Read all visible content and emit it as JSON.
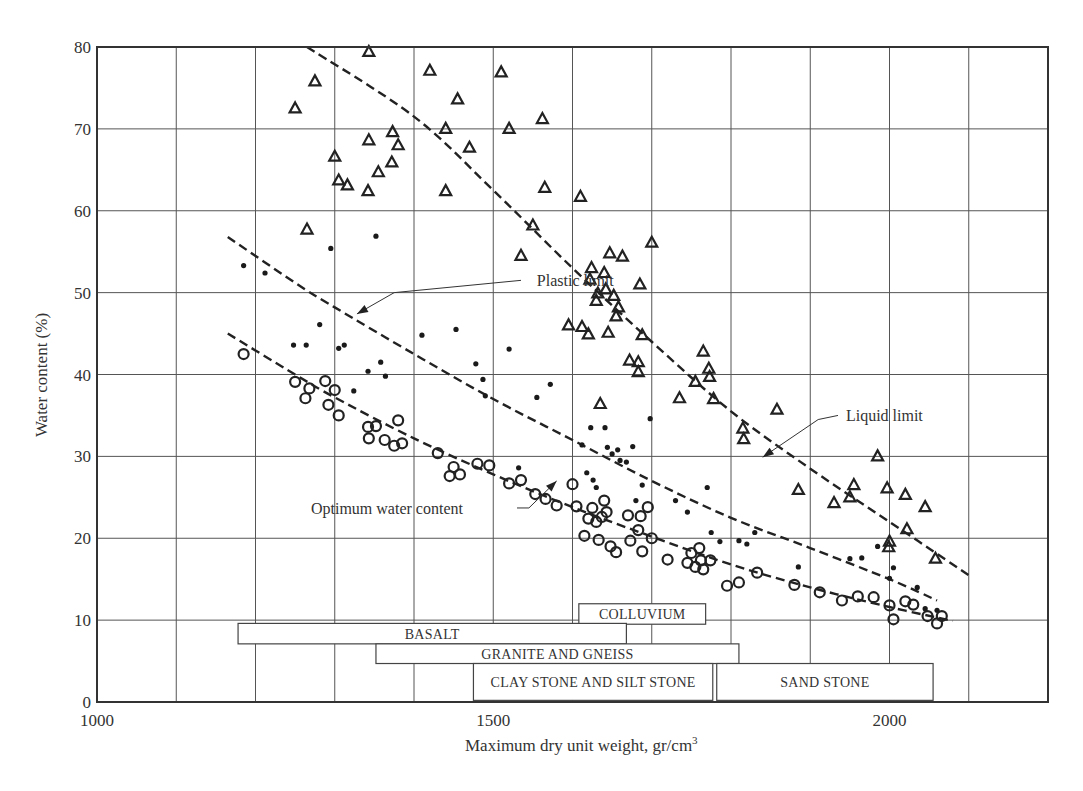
{
  "chart_data": {
    "type": "scatter",
    "title": "",
    "xlabel": "Maximum dry unit weight, gr/cm",
    "xlabel_superscript": "3",
    "ylabel": "Water content (%)",
    "xlim": [
      1000,
      2200
    ],
    "ylim": [
      0,
      80
    ],
    "grid": true,
    "x_gridlines": [
      1100,
      1200,
      1300,
      1400,
      1500,
      1600,
      1700,
      1800,
      1900,
      2000,
      2100
    ],
    "y_gridlines": [
      10,
      20,
      30,
      40,
      50,
      60,
      70
    ],
    "x_ticks": [
      {
        "value": 1000,
        "label": "1000"
      },
      {
        "value": 1500,
        "label": "1500"
      },
      {
        "value": 2000,
        "label": "2000"
      }
    ],
    "y_ticks": [
      {
        "value": 0,
        "label": "0"
      },
      {
        "value": 10,
        "label": "10"
      },
      {
        "value": 20,
        "label": "20"
      },
      {
        "value": 30,
        "label": "30"
      },
      {
        "value": 40,
        "label": "40"
      },
      {
        "value": 50,
        "label": "50"
      },
      {
        "value": 60,
        "label": "60"
      },
      {
        "value": 70,
        "label": "70"
      },
      {
        "value": 80,
        "label": "80"
      }
    ],
    "series": [
      {
        "name": "Liquid limit",
        "marker": "triangle",
        "points": [
          [
            1250,
            72.5
          ],
          [
            1265,
            57.7
          ],
          [
            1275,
            75.8
          ],
          [
            1300,
            66.6
          ],
          [
            1305,
            63.7
          ],
          [
            1316,
            63.1
          ],
          [
            1342,
            62.4
          ],
          [
            1343,
            68.6
          ],
          [
            1343,
            79.4
          ],
          [
            1355,
            64.7
          ],
          [
            1372,
            65.9
          ],
          [
            1373,
            69.6
          ],
          [
            1380,
            68.0
          ],
          [
            1420,
            77.1
          ],
          [
            1440,
            70.0
          ],
          [
            1440,
            62.4
          ],
          [
            1455,
            73.6
          ],
          [
            1470,
            67.7
          ],
          [
            1510,
            76.9
          ],
          [
            1520,
            70.0
          ],
          [
            1535,
            54.5
          ],
          [
            1550,
            58.2
          ],
          [
            1562,
            71.2
          ],
          [
            1565,
            62.8
          ],
          [
            1595,
            46.0
          ],
          [
            1610,
            61.7
          ],
          [
            1612,
            45.8
          ],
          [
            1620,
            44.9
          ],
          [
            1622,
            51.6
          ],
          [
            1624,
            53.0
          ],
          [
            1630,
            49.0
          ],
          [
            1632,
            49.9
          ],
          [
            1635,
            36.4
          ],
          [
            1640,
            52.4
          ],
          [
            1642,
            50.4
          ],
          [
            1645,
            45.1
          ],
          [
            1647,
            54.8
          ],
          [
            1652,
            49.6
          ],
          [
            1655,
            47.1
          ],
          [
            1658,
            48.2
          ],
          [
            1663,
            54.4
          ],
          [
            1672,
            41.7
          ],
          [
            1683,
            40.3
          ],
          [
            1683,
            41.5
          ],
          [
            1685,
            51.0
          ],
          [
            1688,
            44.8
          ],
          [
            1700,
            56.1
          ],
          [
            1735,
            37.1
          ],
          [
            1755,
            39.1
          ],
          [
            1765,
            42.8
          ],
          [
            1772,
            40.7
          ],
          [
            1773,
            39.7
          ],
          [
            1778,
            37.0
          ],
          [
            1815,
            33.4
          ],
          [
            1816,
            32.1
          ],
          [
            1858,
            35.7
          ],
          [
            1885,
            25.9
          ],
          [
            1930,
            24.3
          ],
          [
            1950,
            25.0
          ],
          [
            1955,
            26.5
          ],
          [
            1985,
            30.0
          ],
          [
            1997,
            26.1
          ],
          [
            1999,
            18.9
          ],
          [
            2000,
            19.6
          ],
          [
            2020,
            25.3
          ],
          [
            2022,
            21.1
          ],
          [
            2045,
            23.8
          ],
          [
            2058,
            17.5
          ]
        ]
      },
      {
        "name": "Plastic limit",
        "marker": "dot",
        "points": [
          [
            1185,
            53.3
          ],
          [
            1212,
            52.4
          ],
          [
            1248,
            43.6
          ],
          [
            1264,
            43.6
          ],
          [
            1281,
            46.1
          ],
          [
            1295,
            55.4
          ],
          [
            1305,
            43.2
          ],
          [
            1312,
            43.6
          ],
          [
            1324,
            38.0
          ],
          [
            1342,
            40.4
          ],
          [
            1352,
            56.9
          ],
          [
            1358,
            41.5
          ],
          [
            1364,
            39.8
          ],
          [
            1410,
            44.8
          ],
          [
            1453,
            45.5
          ],
          [
            1478,
            41.3
          ],
          [
            1487,
            39.4
          ],
          [
            1490,
            37.4
          ],
          [
            1520,
            43.1
          ],
          [
            1532,
            28.6
          ],
          [
            1555,
            37.2
          ],
          [
            1572,
            38.8
          ],
          [
            1612,
            31.4
          ],
          [
            1618,
            28.0
          ],
          [
            1623,
            33.5
          ],
          [
            1626,
            27.1
          ],
          [
            1630,
            26.2
          ],
          [
            1641,
            33.5
          ],
          [
            1644,
            31.1
          ],
          [
            1650,
            30.3
          ],
          [
            1657,
            30.8
          ],
          [
            1660,
            29.5
          ],
          [
            1668,
            29.3
          ],
          [
            1676,
            31.2
          ],
          [
            1680,
            24.6
          ],
          [
            1688,
            26.5
          ],
          [
            1698,
            34.6
          ],
          [
            1730,
            24.6
          ],
          [
            1745,
            23.2
          ],
          [
            1770,
            26.2
          ],
          [
            1775,
            20.7
          ],
          [
            1786,
            19.6
          ],
          [
            1810,
            19.7
          ],
          [
            1820,
            19.3
          ],
          [
            1830,
            20.7
          ],
          [
            1885,
            16.5
          ],
          [
            1950,
            17.5
          ],
          [
            1965,
            17.6
          ],
          [
            1985,
            19.0
          ],
          [
            2000,
            15.1
          ],
          [
            2005,
            16.4
          ],
          [
            2035,
            14.0
          ],
          [
            2045,
            11.4
          ],
          [
            2060,
            11.2
          ]
        ]
      },
      {
        "name": "Optimum water content",
        "marker": "circle",
        "points": [
          [
            1185,
            42.5
          ],
          [
            1250,
            39.1
          ],
          [
            1263,
            37.1
          ],
          [
            1268,
            38.3
          ],
          [
            1288,
            39.2
          ],
          [
            1292,
            36.3
          ],
          [
            1300,
            38.1
          ],
          [
            1305,
            35.0
          ],
          [
            1342,
            33.6
          ],
          [
            1343,
            32.2
          ],
          [
            1352,
            33.7
          ],
          [
            1363,
            32.0
          ],
          [
            1375,
            31.3
          ],
          [
            1385,
            31.6
          ],
          [
            1380,
            34.4
          ],
          [
            1430,
            30.4
          ],
          [
            1445,
            27.6
          ],
          [
            1450,
            28.7
          ],
          [
            1458,
            27.8
          ],
          [
            1480,
            29.1
          ],
          [
            1495,
            28.9
          ],
          [
            1520,
            26.7
          ],
          [
            1535,
            27.1
          ],
          [
            1553,
            25.4
          ],
          [
            1566,
            24.8
          ],
          [
            1580,
            24.0
          ],
          [
            1600,
            26.6
          ],
          [
            1605,
            23.9
          ],
          [
            1615,
            20.3
          ],
          [
            1620,
            22.4
          ],
          [
            1625,
            23.7
          ],
          [
            1630,
            22.0
          ],
          [
            1633,
            19.8
          ],
          [
            1637,
            22.6
          ],
          [
            1640,
            24.6
          ],
          [
            1643,
            23.2
          ],
          [
            1648,
            19.0
          ],
          [
            1655,
            18.3
          ],
          [
            1670,
            22.8
          ],
          [
            1673,
            19.7
          ],
          [
            1683,
            21.0
          ],
          [
            1686,
            22.7
          ],
          [
            1688,
            18.4
          ],
          [
            1695,
            23.8
          ],
          [
            1700,
            20.0
          ],
          [
            1720,
            17.4
          ],
          [
            1745,
            17.0
          ],
          [
            1750,
            18.2
          ],
          [
            1755,
            16.5
          ],
          [
            1760,
            18.8
          ],
          [
            1762,
            17.3
          ],
          [
            1765,
            16.2
          ],
          [
            1774,
            17.3
          ],
          [
            1795,
            14.2
          ],
          [
            1810,
            14.6
          ],
          [
            1833,
            15.8
          ],
          [
            1880,
            14.3
          ],
          [
            1912,
            13.4
          ],
          [
            1940,
            12.4
          ],
          [
            1960,
            12.9
          ],
          [
            1980,
            12.8
          ],
          [
            2000,
            11.8
          ],
          [
            2005,
            10.1
          ],
          [
            2020,
            12.3
          ],
          [
            2030,
            11.9
          ],
          [
            2048,
            10.5
          ],
          [
            2060,
            9.6
          ],
          [
            2066,
            10.5
          ]
        ]
      }
    ],
    "trend_lines": [
      {
        "name": "Liquid limit",
        "style": "dashed",
        "points": [
          [
            1265,
            80
          ],
          [
            1400,
            71.5
          ],
          [
            1500,
            62.5
          ],
          [
            1600,
            53.0
          ],
          [
            1700,
            44.0
          ],
          [
            1800,
            35.5
          ],
          [
            1900,
            28.5
          ],
          [
            2000,
            22.0
          ],
          [
            2100,
            15.5
          ]
        ]
      },
      {
        "name": "Plastic limit",
        "style": "dashed",
        "points": [
          [
            1165,
            56.8
          ],
          [
            1250,
            51.2
          ],
          [
            1300,
            48.2
          ],
          [
            1400,
            42.5
          ],
          [
            1500,
            37.0
          ],
          [
            1600,
            32.0
          ],
          [
            1700,
            27.0
          ],
          [
            1800,
            22.5
          ],
          [
            1900,
            18.8
          ],
          [
            2000,
            15.0
          ],
          [
            2060,
            12.4
          ]
        ]
      },
      {
        "name": "Optimum water content",
        "style": "dashed",
        "points": [
          [
            1165,
            45.0
          ],
          [
            1250,
            40.0
          ],
          [
            1300,
            37.2
          ],
          [
            1400,
            32.2
          ],
          [
            1500,
            27.8
          ],
          [
            1600,
            23.8
          ],
          [
            1700,
            20.2
          ],
          [
            1800,
            16.8
          ],
          [
            1900,
            14.0
          ],
          [
            2000,
            11.6
          ],
          [
            2080,
            9.9
          ]
        ]
      }
    ],
    "annotations": [
      {
        "text": "Plastic limit",
        "text_at": [
          1555,
          51.5
        ],
        "arrow_to": [
          1328,
          47.4
        ],
        "elbow": [
          1535,
          51.5
        ],
        "bend": [
          1375,
          50.0
        ]
      },
      {
        "text": "Liquid limit",
        "text_at": [
          1945,
          35.0
        ],
        "arrow_to": [
          1840,
          29.9
        ],
        "elbow": [
          1935,
          35.0
        ],
        "bend": [
          1910,
          34.5
        ]
      },
      {
        "text": "Optimum water content",
        "text_at": [
          1270,
          23.7
        ],
        "arrow_to": [
          1580,
          27.0
        ],
        "elbow": [
          1530,
          23.7
        ],
        "bend": [
          1545,
          23.7
        ]
      }
    ],
    "rock_type_ranges": [
      {
        "label": "COLLUVIUM",
        "x_start": 1608,
        "x_end": 1768,
        "y_top": 12.0,
        "y_bottom": 9.5
      },
      {
        "label": "BASALT",
        "x_start": 1178,
        "x_end": 1668,
        "y_top": 9.6,
        "y_bottom": 7.1
      },
      {
        "label": "GRANITE AND GNEISS",
        "x_start": 1352,
        "x_end": 1810,
        "y_top": 7.1,
        "y_bottom": 4.7
      },
      {
        "label": "CLAY STONE AND SILT STONE",
        "x_start": 1475,
        "x_end": 1777,
        "y_top": 4.7,
        "y_bottom": 0.2
      },
      {
        "label": "SAND STONE",
        "x_start": 1782,
        "x_end": 2055,
        "y_top": 4.7,
        "y_bottom": 0.2
      }
    ]
  }
}
